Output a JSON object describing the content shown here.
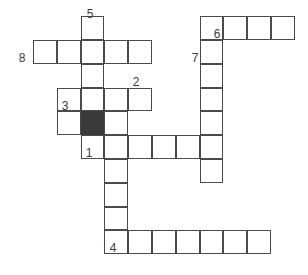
{
  "puzzle": {
    "type": "crossword-grid",
    "cell_size": 23.8,
    "origin_x": 33,
    "origin_y": 40,
    "colors": {
      "cell_fill": "#ffffff",
      "cell_border": "#4a4a4a",
      "blocked_fill": "#3a3a3a",
      "number_text": "#3c3c3c",
      "background": "#ffffff"
    },
    "clue_numbers": [
      {
        "label": "5",
        "x": 82,
        "y": 8
      },
      {
        "label": "8",
        "x": 14,
        "y": 52
      },
      {
        "label": "6",
        "x": 209,
        "y": 28
      },
      {
        "label": "7",
        "x": 187,
        "y": 52
      },
      {
        "label": "2",
        "x": 128,
        "y": 76
      },
      {
        "label": "3",
        "x": 57,
        "y": 100
      },
      {
        "label": "1",
        "x": 81,
        "y": 147
      },
      {
        "label": "4",
        "x": 105,
        "y": 242
      }
    ],
    "entries": [
      {
        "number": "5",
        "direction": "down",
        "col": 2,
        "row": -1,
        "length": 6
      },
      {
        "number": "8",
        "direction": "across",
        "col": 0,
        "row": 0,
        "length": 5
      },
      {
        "number": "6",
        "direction": "down",
        "col": 7,
        "row": -1,
        "length": 7
      },
      {
        "number": "7",
        "direction": "across",
        "col": 7,
        "row": 0,
        "length": 4
      },
      {
        "number": "2",
        "direction": "across",
        "col": 1,
        "row": 2,
        "length": 4
      },
      {
        "number": "3",
        "direction": "across",
        "col": 1,
        "row": 3,
        "length": 3
      },
      {
        "number": "1",
        "direction": "across",
        "col": 2,
        "row": 4,
        "length": 6
      },
      {
        "number": "4",
        "direction": "across",
        "col": 3,
        "row": 8,
        "length": 7
      },
      {
        "number": "1",
        "direction": "down",
        "col": 3,
        "row": 4,
        "length": 5
      }
    ],
    "cells": [
      {
        "col": 2,
        "row": -1,
        "blocked": false
      },
      {
        "col": 0,
        "row": 0,
        "blocked": false
      },
      {
        "col": 1,
        "row": 0,
        "blocked": false
      },
      {
        "col": 2,
        "row": 0,
        "blocked": false
      },
      {
        "col": 3,
        "row": 0,
        "blocked": false
      },
      {
        "col": 4,
        "row": 0,
        "blocked": false
      },
      {
        "col": 7,
        "row": -1,
        "blocked": false
      },
      {
        "col": 8,
        "row": -1,
        "blocked": false
      },
      {
        "col": 9,
        "row": -1,
        "blocked": false
      },
      {
        "col": 10,
        "row": -1,
        "blocked": false
      },
      {
        "col": 2,
        "row": 1,
        "blocked": false
      },
      {
        "col": 7,
        "row": 0,
        "blocked": false
      },
      {
        "col": 7,
        "row": 1,
        "blocked": false
      },
      {
        "col": 1,
        "row": 2,
        "blocked": false
      },
      {
        "col": 2,
        "row": 2,
        "blocked": false
      },
      {
        "col": 3,
        "row": 2,
        "blocked": false
      },
      {
        "col": 4,
        "row": 2,
        "blocked": false
      },
      {
        "col": 7,
        "row": 2,
        "blocked": false
      },
      {
        "col": 1,
        "row": 3,
        "blocked": false
      },
      {
        "col": 2,
        "row": 3,
        "blocked": true
      },
      {
        "col": 3,
        "row": 3,
        "blocked": false
      },
      {
        "col": 7,
        "row": 3,
        "blocked": false
      },
      {
        "col": 2,
        "row": 4,
        "blocked": false
      },
      {
        "col": 3,
        "row": 4,
        "blocked": false
      },
      {
        "col": 4,
        "row": 4,
        "blocked": false
      },
      {
        "col": 5,
        "row": 4,
        "blocked": false
      },
      {
        "col": 6,
        "row": 4,
        "blocked": false
      },
      {
        "col": 7,
        "row": 4,
        "blocked": false
      },
      {
        "col": 7,
        "row": 5,
        "blocked": false
      },
      {
        "col": 3,
        "row": 5,
        "blocked": false
      },
      {
        "col": 3,
        "row": 6,
        "blocked": false
      },
      {
        "col": 3,
        "row": 7,
        "blocked": false
      },
      {
        "col": 3,
        "row": 8,
        "blocked": false
      },
      {
        "col": 4,
        "row": 8,
        "blocked": false
      },
      {
        "col": 5,
        "row": 8,
        "blocked": false
      },
      {
        "col": 6,
        "row": 8,
        "blocked": false
      },
      {
        "col": 7,
        "row": 8,
        "blocked": false
      },
      {
        "col": 8,
        "row": 8,
        "blocked": false
      },
      {
        "col": 9,
        "row": 8,
        "blocked": false
      }
    ]
  }
}
